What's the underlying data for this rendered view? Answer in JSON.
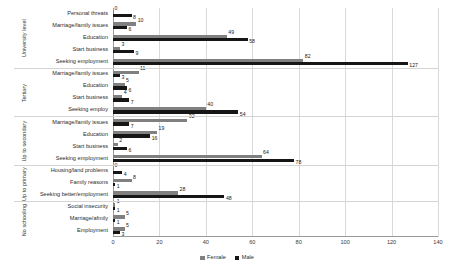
{
  "chart_data": {
    "type": "bar",
    "orientation": "horizontal",
    "title": "",
    "xlabel": "",
    "ylabel": "",
    "xlim": [
      0,
      140
    ],
    "xticks": [
      "0",
      "20",
      "40",
      "60",
      "80",
      "100",
      "120",
      "140"
    ],
    "grid": true,
    "legend_position": "bottom",
    "series": [
      {
        "name": "Female",
        "color": "#808080"
      },
      {
        "name": "Male",
        "color": "#161616"
      }
    ],
    "groups": [
      {
        "label": "University level",
        "categories": [
          {
            "label": "Personal threats",
            "Female": 0,
            "Male": 8
          },
          {
            "label": "Marriage/family issues",
            "Female": 10,
            "Male": 6
          },
          {
            "label": "Education",
            "Female": 49,
            "Male": 58
          },
          {
            "label": "Start business",
            "Female": 3,
            "Male": 9
          },
          {
            "label": "Seeking employment",
            "Female": 82,
            "Male": 127
          }
        ]
      },
      {
        "label": "Tertiary",
        "categories": [
          {
            "label": "Marriage/family issues",
            "Female": 11,
            "Male": 3
          },
          {
            "label": "Education",
            "Female": 5,
            "Male": 6
          },
          {
            "label": "Start business",
            "Female": 4,
            "Male": 7
          },
          {
            "label": "Seeking employ",
            "Female": 40,
            "Male": 54
          }
        ]
      },
      {
        "label": "Up to secondary",
        "categories": [
          {
            "label": "Marriage/family issues",
            "Female": 32,
            "Male": 7
          },
          {
            "label": "Education",
            "Female": 19,
            "Male": 16
          },
          {
            "label": "Start business",
            "Female": 2,
            "Male": 6
          },
          {
            "label": "Seeking employment",
            "Female": 64,
            "Male": 78
          }
        ]
      },
      {
        "label": "Up to primary",
        "categories": [
          {
            "label": "Housing/land problems",
            "Female": 0,
            "Male": 4
          },
          {
            "label": "Family reasons",
            "Female": 8,
            "Male": 1
          },
          {
            "label": "Seeking better/employment",
            "Female": 28,
            "Male": 48
          }
        ]
      },
      {
        "label": "No schooling",
        "categories": [
          {
            "label": "Social insecurity",
            "Female": 1,
            "Male": 1
          },
          {
            "label": "Marriage/afmily",
            "Female": 5,
            "Male": 1
          },
          {
            "label": "Employment",
            "Female": 5,
            "Male": 3
          }
        ]
      }
    ]
  }
}
